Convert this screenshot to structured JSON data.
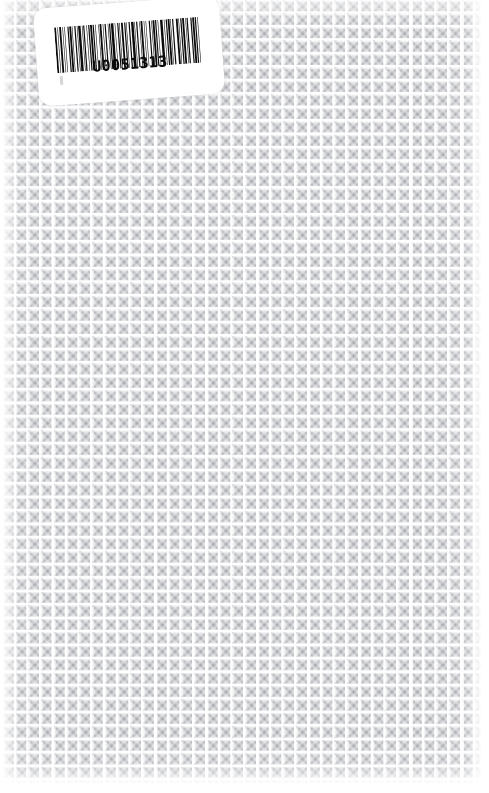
{
  "document": {
    "kind": "scanned-book-cover",
    "background_pattern_name": "diamond-motif-tile",
    "background_color": "#fdfdfd",
    "pattern_color": "#9a9ca2"
  },
  "label": {
    "name": "library-barcode-label",
    "background_color": "#ffffff",
    "rotation_degrees": -4.2,
    "barcode": {
      "symbology": "code-39",
      "value": "U0051313",
      "human_readable_text": "U0051313",
      "bar_color": "#0b0b0b",
      "modules": [
        3,
        2,
        1,
        2,
        3,
        2,
        1,
        2,
        1,
        4,
        2,
        1,
        3,
        1,
        1,
        3,
        2,
        2,
        1,
        1,
        4,
        2,
        1,
        1,
        2,
        3,
        1,
        2,
        2,
        1,
        3,
        1,
        2,
        2,
        1,
        4,
        1,
        1,
        3,
        2,
        1,
        2,
        2,
        3,
        1,
        1,
        2,
        1,
        4,
        2,
        1,
        3,
        2,
        1,
        1,
        2,
        3,
        2,
        2,
        1,
        1,
        3,
        2,
        2,
        4,
        1,
        1,
        2,
        2,
        3,
        1,
        1,
        3,
        2,
        1,
        2,
        1,
        4,
        2,
        2,
        1,
        1,
        3,
        1,
        2,
        2,
        1,
        3,
        4,
        2,
        1,
        2,
        2,
        1,
        3,
        1,
        1,
        2,
        2,
        4,
        3,
        1,
        1,
        2,
        2,
        1,
        3,
        2,
        1,
        1,
        2,
        4,
        2,
        1,
        3,
        1,
        2,
        2,
        1,
        3
      ]
    }
  }
}
